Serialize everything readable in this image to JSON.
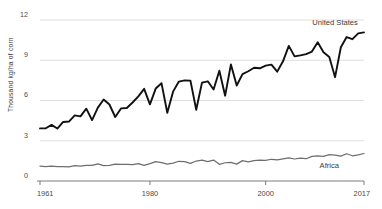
{
  "chart_data": {
    "type": "line",
    "title": "",
    "xlabel": "",
    "ylabel": "Thousand kg/ha of corn",
    "xlim": [
      1961,
      2017
    ],
    "ylim": [
      0,
      12
    ],
    "grid": true,
    "legend_position": "inline-right",
    "y_ticks": [
      "0",
      "3",
      "6",
      "9",
      "12"
    ],
    "y_tick_values": [
      0,
      3,
      6,
      9,
      12
    ],
    "x_ticks": [
      "1961",
      "1980",
      "2000",
      "2017"
    ],
    "x_tick_values": [
      1961,
      1980,
      2000,
      2017
    ],
    "x": [
      1961,
      1962,
      1963,
      1964,
      1965,
      1966,
      1967,
      1968,
      1969,
      1970,
      1971,
      1972,
      1973,
      1974,
      1975,
      1976,
      1977,
      1978,
      1979,
      1980,
      1981,
      1982,
      1983,
      1984,
      1985,
      1986,
      1987,
      1988,
      1989,
      1990,
      1991,
      1992,
      1993,
      1994,
      1995,
      1996,
      1997,
      1998,
      1999,
      2000,
      2001,
      2002,
      2003,
      2004,
      2005,
      2006,
      2007,
      2008,
      2009,
      2010,
      2011,
      2012,
      2013,
      2014,
      2015,
      2016,
      2017
    ],
    "series": [
      {
        "name": "United States",
        "color": "#111111",
        "label_x": 2012,
        "label_y": 11.6,
        "values": [
          3.92,
          3.93,
          4.18,
          3.91,
          4.4,
          4.43,
          4.89,
          4.82,
          5.39,
          4.54,
          5.47,
          6.07,
          5.7,
          4.77,
          5.41,
          5.44,
          5.85,
          6.31,
          6.87,
          5.71,
          6.89,
          7.29,
          5.09,
          6.66,
          7.41,
          7.5,
          7.48,
          5.31,
          7.33,
          7.43,
          6.82,
          8.22,
          6.36,
          8.69,
          7.12,
          7.97,
          8.18,
          8.44,
          8.4,
          8.6,
          8.67,
          8.15,
          8.92,
          10.07,
          9.29,
          9.36,
          9.46,
          9.65,
          10.34,
          9.59,
          9.24,
          7.74,
          9.97,
          10.73,
          10.57,
          11.0,
          11.08
        ]
      },
      {
        "name": "Africa",
        "color": "#6e6e6e",
        "label_x": 2011,
        "label_y": 0.95,
        "values": [
          1.1,
          1.08,
          1.1,
          1.08,
          1.07,
          1.05,
          1.14,
          1.11,
          1.17,
          1.17,
          1.28,
          1.15,
          1.16,
          1.25,
          1.24,
          1.24,
          1.22,
          1.3,
          1.16,
          1.3,
          1.45,
          1.37,
          1.26,
          1.33,
          1.47,
          1.45,
          1.31,
          1.49,
          1.55,
          1.44,
          1.56,
          1.24,
          1.36,
          1.39,
          1.26,
          1.52,
          1.43,
          1.52,
          1.55,
          1.53,
          1.62,
          1.58,
          1.65,
          1.72,
          1.64,
          1.71,
          1.66,
          1.83,
          1.87,
          1.84,
          1.96,
          1.93,
          1.85,
          2.03,
          1.88,
          1.94,
          2.05
        ]
      }
    ]
  }
}
